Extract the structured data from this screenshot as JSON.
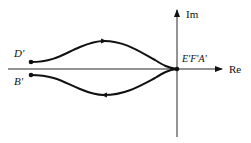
{
  "diagram": {
    "type": "complex-plane-locus",
    "axes": {
      "real_label": "Re",
      "imag_label": "Im"
    },
    "points": {
      "origin_label": "E'F'A'",
      "upper_start_label": "D'",
      "lower_start_label": "B'"
    },
    "curves": [
      {
        "name": "upper-path",
        "from": "D'",
        "to": "E'F'A'",
        "direction": "toward origin"
      },
      {
        "name": "lower-path",
        "from": "E'F'A'",
        "to": "B'",
        "direction": "away from origin"
      }
    ],
    "colors": {
      "stroke": "#111111",
      "background": "#ffffff"
    }
  }
}
